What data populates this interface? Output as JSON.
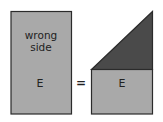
{
  "diagram": {
    "left_panel": {
      "label_line1": "wrong",
      "label_line2": "side",
      "letter": "E",
      "fill": "#a9a9a9",
      "stroke": "#2b2b2b"
    },
    "operator": "=",
    "right_panel": {
      "letter": "E",
      "square_fill": "#a9a9a9",
      "triangle_fill": "#4a4a4a",
      "stroke": "#2b2b2b"
    }
  }
}
